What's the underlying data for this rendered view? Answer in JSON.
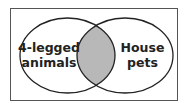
{
  "diagram": {
    "type": "venn",
    "sets": [
      {
        "label_lines": [
          "4-legged",
          "animals"
        ]
      },
      {
        "label_lines": [
          "House",
          "pets"
        ]
      }
    ],
    "intersection": {
      "shaded": true
    }
  },
  "colors": {
    "background": "#ffffff",
    "stroke": "#222222",
    "frame": "#555555",
    "intersection_fill": "#b8b8b8"
  }
}
